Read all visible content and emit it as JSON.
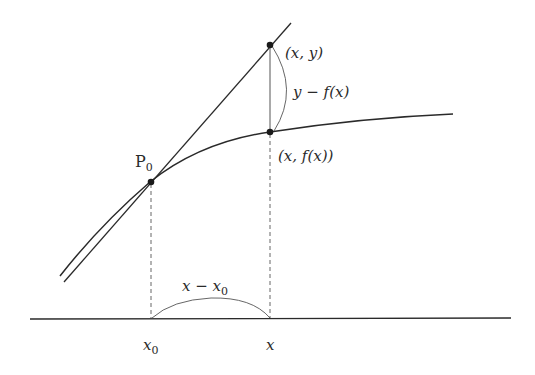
{
  "diagram": {
    "labels": {
      "p0": "P",
      "p0_sub": "0",
      "point_xy": "(x, y)",
      "point_xfx": "(x, f(x))",
      "diff_vertical": "y − f(x)",
      "diff_horizontal_main": "x − x",
      "diff_horizontal_sub": "0",
      "axis_x0_main": "x",
      "axis_x0_sub": "0",
      "axis_x": "x"
    },
    "colors": {
      "line": "#2a2a2a",
      "dashed": "#555555",
      "background": "#ffffff"
    }
  }
}
